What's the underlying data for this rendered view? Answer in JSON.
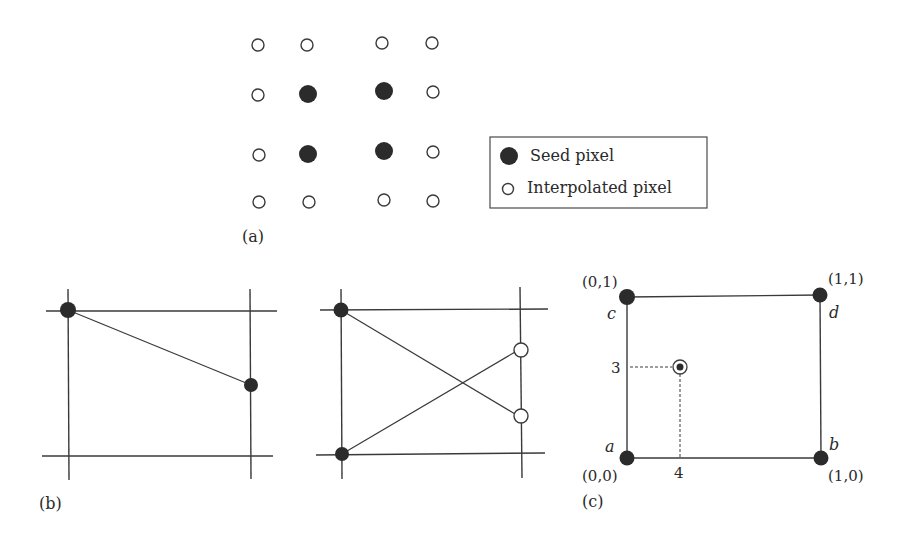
{
  "figure": {
    "panel_a": {
      "label": "(a)",
      "grid": {
        "rows": 4,
        "cols": 4,
        "pattern": [
          [
            "interpolated",
            "interpolated",
            "interpolated",
            "interpolated"
          ],
          [
            "interpolated",
            "seed",
            "seed",
            "interpolated"
          ],
          [
            "interpolated",
            "seed",
            "seed",
            "interpolated"
          ],
          [
            "interpolated",
            "interpolated",
            "interpolated",
            "interpolated"
          ]
        ]
      },
      "legend": {
        "items": [
          {
            "symbol": "filled-circle",
            "label": "Seed pixel"
          },
          {
            "symbol": "open-circle",
            "label": "Interpolated pixel"
          }
        ]
      }
    },
    "panel_b": {
      "label": "(b)",
      "left_diagram": {
        "description": "line between two seed pixels across grid cell"
      },
      "right_diagram": {
        "description": "two seed pixels connected to two interpolated pixels with crossing lines"
      }
    },
    "panel_c": {
      "label": "(c)",
      "corners": [
        {
          "coord": "(0,1)",
          "name": "c"
        },
        {
          "coord": "(1,1)",
          "name": "d"
        },
        {
          "coord": "(0,0)",
          "name": "a"
        },
        {
          "coord": "(1,0)",
          "name": "b"
        }
      ],
      "point": {
        "y_tick": "3",
        "x_tick": "4"
      }
    }
  }
}
